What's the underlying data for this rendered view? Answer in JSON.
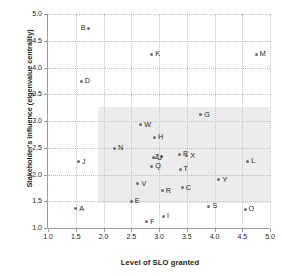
{
  "chart_data": {
    "type": "scatter",
    "title": "",
    "xlabel": "Level of SLO granted",
    "ylabel": "Stakeholder's influence (eigenvalue centrality)",
    "xlim": [
      1.0,
      5.0
    ],
    "ylim": [
      1.0,
      5.0
    ],
    "xticks": [
      "1.0",
      "1.5",
      "2.0",
      "2.5",
      "3.0",
      "3.5",
      "4.0",
      "4.5",
      "5.0"
    ],
    "yticks": [
      "1.0",
      "1.5",
      "2.0",
      "2.5",
      "3.0",
      "3.5",
      "4.0",
      "4.5",
      "5.0"
    ],
    "xtick_values": [
      1.0,
      1.5,
      2.0,
      2.5,
      3.0,
      3.5,
      4.0,
      4.5,
      5.0
    ],
    "ytick_values": [
      1.0,
      1.5,
      2.0,
      2.5,
      3.0,
      3.5,
      4.0,
      4.5,
      5.0
    ],
    "grid": true,
    "grid_style": "dotted",
    "legend": "none",
    "marker_color": "#6f6f6f",
    "grid_color": "#c2c2c2",
    "axis_color": "#9b9b9b",
    "text_color": "#231f20",
    "shaded_region": {
      "fill": "#ececec",
      "x0": 1.9,
      "x1": 5.0,
      "y0": 1.47,
      "y1": 3.27,
      "note": "light grey band highlighting central cluster"
    },
    "points": [
      {
        "label": "B",
        "x": 1.73,
        "y": 4.73,
        "label_side": "left"
      },
      {
        "label": "M",
        "x": 4.75,
        "y": 4.25,
        "label_side": "right"
      },
      {
        "label": "K",
        "x": 2.87,
        "y": 4.25,
        "label_side": "right"
      },
      {
        "label": "D",
        "x": 1.6,
        "y": 3.74,
        "label_side": "right"
      },
      {
        "label": "G",
        "x": 3.75,
        "y": 3.12,
        "label_side": "right"
      },
      {
        "label": "W",
        "x": 2.67,
        "y": 2.93,
        "label_side": "right"
      },
      {
        "label": "H",
        "x": 2.92,
        "y": 2.7,
        "label_side": "right"
      },
      {
        "label": "N",
        "x": 2.2,
        "y": 2.49,
        "label_side": "right"
      },
      {
        "label": "P",
        "x": 3.37,
        "y": 2.38,
        "label_side": "right"
      },
      {
        "label": "X",
        "x": 3.5,
        "y": 2.35,
        "label_side": "right"
      },
      {
        "label": "Z",
        "x": 3.05,
        "y": 2.33,
        "label_side": "left"
      },
      {
        "label": "U",
        "x": 2.9,
        "y": 2.31,
        "label_side": "right"
      },
      {
        "label": "L",
        "x": 4.6,
        "y": 2.25,
        "label_side": "right"
      },
      {
        "label": "J",
        "x": 1.55,
        "y": 2.24,
        "label_side": "right"
      },
      {
        "label": "Q",
        "x": 2.87,
        "y": 2.15,
        "label_side": "right"
      },
      {
        "label": "T",
        "x": 3.38,
        "y": 2.1,
        "label_side": "right"
      },
      {
        "label": "Y",
        "x": 4.08,
        "y": 1.9,
        "label_side": "right"
      },
      {
        "label": "V",
        "x": 2.62,
        "y": 1.83,
        "label_side": "right"
      },
      {
        "label": "C",
        "x": 3.42,
        "y": 1.75,
        "label_side": "right"
      },
      {
        "label": "R",
        "x": 3.06,
        "y": 1.7,
        "label_side": "right"
      },
      {
        "label": "E",
        "x": 2.5,
        "y": 1.5,
        "label_side": "right"
      },
      {
        "label": "S",
        "x": 3.9,
        "y": 1.41,
        "label_side": "right"
      },
      {
        "label": "A",
        "x": 1.5,
        "y": 1.36,
        "label_side": "right"
      },
      {
        "label": "O",
        "x": 4.55,
        "y": 1.35,
        "label_side": "right"
      },
      {
        "label": "I",
        "x": 3.08,
        "y": 1.22,
        "label_side": "right"
      },
      {
        "label": "F",
        "x": 2.78,
        "y": 1.12,
        "label_side": "right"
      }
    ]
  }
}
